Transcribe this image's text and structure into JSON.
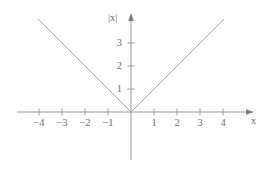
{
  "chart_data": {
    "type": "line",
    "title": "",
    "xlabel": "x",
    "ylabel": "|x|",
    "xlim": [
      -4.95,
      5.1
    ],
    "ylim": [
      -2.1,
      4.3
    ],
    "grid": false,
    "legend": null,
    "x_ticks": [
      -4,
      -3,
      -2,
      -1,
      1,
      2,
      3,
      4
    ],
    "x_tick_labels": [
      "−4",
      "−3",
      "−2",
      "−1",
      "1",
      "2",
      "3",
      "4"
    ],
    "y_ticks": [
      1,
      2,
      3
    ],
    "y_tick_labels": [
      "1",
      "2",
      "3"
    ],
    "series": [
      {
        "name": "|x|",
        "x": [
          -4.05,
          0,
          4.05
        ],
        "values": [
          4.05,
          0,
          4.05
        ]
      }
    ],
    "annotations": []
  },
  "axes": {
    "x_axis_label": "x",
    "y_axis_label": "|x|",
    "x_arrow": "arrow-right",
    "y_arrow": "arrow-up"
  },
  "colors": {
    "curve": "#a8a8a8",
    "axis": "#9a9a9a",
    "tick_text": "#6f6f6f",
    "background": "#ffffff"
  },
  "ticks": {
    "x": [
      {
        "label": "−4",
        "left": 28,
        "top": 118
      },
      {
        "label": "−3",
        "left": 51,
        "top": 118
      },
      {
        "label": "−2",
        "left": 74,
        "top": 118
      },
      {
        "label": "−1",
        "left": 97,
        "top": 118
      },
      {
        "label": "1",
        "left": 143,
        "top": 118
      },
      {
        "label": "2",
        "left": 166,
        "top": 118
      },
      {
        "label": "3",
        "left": 189,
        "top": 118
      },
      {
        "label": "4",
        "left": 212,
        "top": 118
      }
    ],
    "y": [
      {
        "label": "3",
        "left": 108,
        "top": 38
      },
      {
        "label": "2",
        "left": 108,
        "top": 61
      },
      {
        "label": "1",
        "left": 108,
        "top": 84
      }
    ]
  }
}
